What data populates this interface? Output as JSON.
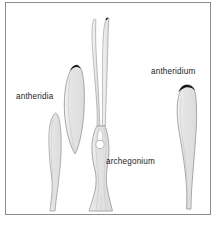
{
  "figure": {
    "background_color": "#ffffff",
    "frame": {
      "name": "figure-border",
      "stroke_color": "#8c8c8c",
      "x": 5,
      "y": 2,
      "width": 206,
      "height": 213
    },
    "labels": {
      "antheridia": "antheridia",
      "antheridium": "antheridium",
      "archegonium": "archegonium"
    },
    "label_color": "#1d1d1d",
    "style": {
      "organ_fill": "#e3e3e3",
      "organ_fill_light": "#eeeeee",
      "organ_stroke": "#9a9a9a",
      "tip_dark": "#1a1a1a",
      "egg_fill": "#ffffff",
      "egg_stroke": "#a9a9a9"
    },
    "structures": [
      {
        "name": "antheridium-small-left",
        "kind": "antheridium",
        "label_ref": "antheridia",
        "has_dark_tip": false,
        "bbox": [
          44,
          112,
          24,
          100
        ]
      },
      {
        "name": "antheridium-large-left",
        "kind": "antheridium",
        "label_ref": "antheridia",
        "has_dark_tip": true,
        "bbox": [
          62,
          64,
          26,
          90
        ]
      },
      {
        "name": "archegonium-center",
        "kind": "archegonium",
        "label_ref": "archegonium",
        "has_dark_tip": true,
        "has_egg_cell": true,
        "egg_cell": {
          "cx": 100,
          "cy": 144,
          "r": 4.2
        },
        "neck_split": true,
        "bbox": [
          86,
          16,
          30,
          196
        ]
      },
      {
        "name": "antheridium-right",
        "kind": "antheridium",
        "label_ref": "antheridium",
        "has_dark_tip": true,
        "bbox": [
          176,
          84,
          22,
          124
        ]
      }
    ]
  }
}
